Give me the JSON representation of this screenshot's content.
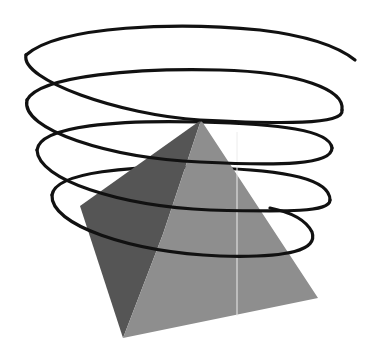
{
  "figure": {
    "background": "#ffffff",
    "pyramid": {
      "apex": [
        201,
        120
      ],
      "left_corner": [
        80,
        206
      ],
      "bottom_corner": [
        123,
        338
      ],
      "right_corner": [
        318,
        298
      ],
      "ridge_mid": [
        163,
        234
      ],
      "dark_face_color": "#555555",
      "light_face_color": "#8e8e8e",
      "highlight_line_color": "#ececec",
      "highlight_line_x": 237,
      "highlight_line_y": [
        132,
        316
      ]
    },
    "helix": {
      "stroke_color": "#111111",
      "stroke_width": 3.2,
      "end_point": [
        355,
        60
      ]
    }
  }
}
